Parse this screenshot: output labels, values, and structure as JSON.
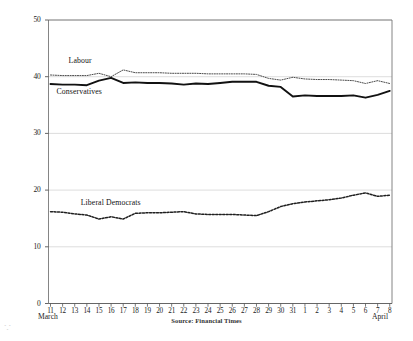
{
  "chart_data": {
    "type": "line",
    "title": "",
    "subtitle": "",
    "xlabel": "",
    "ylabel": "Average Poll Rating %",
    "source": "Source:  Financial Times",
    "ylim": [
      0,
      50
    ],
    "y_ticks": [
      0,
      10,
      20,
      30,
      40,
      50
    ],
    "grid": "horizontal-light",
    "legend_position": "inline-annotations",
    "x_axis": {
      "month_start_label": "March",
      "month_end_label": "April",
      "tick_labels": [
        "11",
        "12",
        "13",
        "14",
        "15",
        "16",
        "17",
        "18",
        "19",
        "20",
        "21",
        "22",
        "23",
        "24",
        "25",
        "26",
        "27",
        "28",
        "29",
        "30",
        "31",
        "1",
        "2",
        "3",
        "4",
        "5",
        "6",
        "7",
        "8"
      ]
    },
    "x": [
      "11",
      "12",
      "13",
      "14",
      "15",
      "16",
      "17",
      "18",
      "19",
      "20",
      "21",
      "22",
      "23",
      "24",
      "25",
      "26",
      "27",
      "28",
      "29",
      "30",
      "31",
      "1",
      "2",
      "3",
      "4",
      "5",
      "6",
      "7",
      "8"
    ],
    "series": [
      {
        "name": "Labour",
        "style": "dotted-thin",
        "color": "#4d4d4d",
        "label_x": "12",
        "label_y": 42.6,
        "values": [
          40.3,
          40.2,
          40.2,
          40.2,
          40.6,
          40.0,
          41.2,
          40.7,
          40.7,
          40.7,
          40.6,
          40.6,
          40.6,
          40.5,
          40.5,
          40.5,
          40.5,
          40.4,
          39.7,
          39.4,
          39.9,
          39.6,
          39.5,
          39.5,
          39.4,
          39.3,
          38.8,
          39.3,
          38.8
        ]
      },
      {
        "name": "Conservatives",
        "style": "solid-thick",
        "color": "#111111",
        "label_x": "11",
        "label_y": 37.1,
        "values": [
          38.7,
          38.6,
          38.6,
          38.5,
          39.3,
          39.8,
          38.9,
          39.0,
          38.9,
          38.9,
          38.8,
          38.6,
          38.8,
          38.7,
          38.9,
          39.1,
          39.1,
          39.1,
          38.4,
          38.2,
          36.5,
          36.7,
          36.6,
          36.6,
          36.6,
          36.7,
          36.3,
          36.8,
          37.5
        ]
      },
      {
        "name": "Liberal Democrats",
        "style": "dashed-dotted",
        "color": "#1f1f1f",
        "label_x": "13",
        "label_y": 17.5,
        "values": [
          16.2,
          16.1,
          15.8,
          15.6,
          14.9,
          15.3,
          14.9,
          15.9,
          16.0,
          16.0,
          16.1,
          16.2,
          15.8,
          15.7,
          15.7,
          15.7,
          15.6,
          15.5,
          16.2,
          17.1,
          17.6,
          17.9,
          18.1,
          18.3,
          18.6,
          19.1,
          19.5,
          18.9,
          19.1
        ]
      }
    ]
  }
}
